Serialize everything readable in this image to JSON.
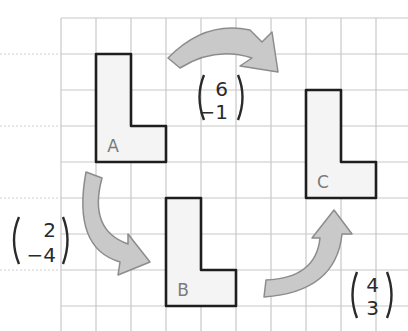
{
  "diagram": {
    "type": "translation-on-grid",
    "grid": {
      "origin_x": 61,
      "origin_y": 18,
      "cell_w": 35,
      "cell_h": 36,
      "cols": 10,
      "rows": 9,
      "line_color": "#c8c8c8",
      "dotted_left_lines_y": [
        54,
        126,
        198,
        270
      ]
    },
    "shapes": [
      {
        "id": "A",
        "label": "A",
        "col": 1,
        "row": 1
      },
      {
        "id": "B",
        "label": "B",
        "col": 3,
        "row": 5
      },
      {
        "id": "C",
        "label": "C",
        "col": 7,
        "row": 2
      }
    ],
    "translations": [
      {
        "from": "A",
        "to": "C",
        "vector_top": "6",
        "vector_bottom": "−1"
      },
      {
        "from": "A",
        "to": "B",
        "vector_top": "2",
        "vector_bottom": "−4"
      },
      {
        "from": "B",
        "to": "C",
        "vector_top": "4",
        "vector_bottom": "3"
      }
    ],
    "colors": {
      "shape_fill": "#f4f4f4",
      "shape_stroke": "#1e1e1e",
      "label_color": "#7a7a7a",
      "arrow_fill": "#c9c9c9",
      "arrow_stroke": "#8c8c8c",
      "text_color": "#2a2a2a"
    }
  }
}
